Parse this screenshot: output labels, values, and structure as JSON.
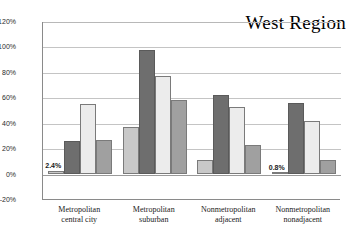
{
  "chart_data": {
    "type": "bar",
    "title": "West Region",
    "xlabel": "",
    "ylabel": "",
    "ylim": [
      -20,
      120
    ],
    "ytick_labels": [
      "120%",
      "100%",
      "80%",
      "60%",
      "40%",
      "20%",
      "0%",
      "-20%"
    ],
    "ytick_values": [
      120,
      100,
      80,
      60,
      40,
      20,
      0,
      -20
    ],
    "grid": true,
    "legend": "none",
    "categories": [
      "Metropolitan central city",
      "Metropolitan suburban",
      "Nonmetropolitan adjacent",
      "Nonmetropolitan nonadjacent"
    ],
    "category_lines": [
      [
        "Metropolitan",
        "central city"
      ],
      [
        "Metropolitan",
        "suburban"
      ],
      [
        "Nonmetropolitan",
        "adjacent"
      ],
      [
        "Nonmetropolitan",
        "nonadjacent"
      ]
    ],
    "series": [
      {
        "name": "Series 1",
        "color": "#c8c8c8",
        "values": [
          2.4,
          36.5,
          10.5,
          0.8
        ]
      },
      {
        "name": "Series 2",
        "color": "#6e6e6e",
        "values": [
          26.0,
          97.5,
          62.0,
          55.5
        ]
      },
      {
        "name": "Series 3",
        "color": "#ececec",
        "values": [
          55.0,
          77.0,
          52.0,
          41.5
        ]
      },
      {
        "name": "Series 4",
        "color": "#a0a0a0",
        "values": [
          26.5,
          58.0,
          22.5,
          11.0
        ]
      }
    ],
    "data_labels": [
      {
        "group": 0,
        "series": 0,
        "text": "2.4%"
      },
      {
        "group": 3,
        "series": 0,
        "text": "0.8%"
      }
    ]
  }
}
